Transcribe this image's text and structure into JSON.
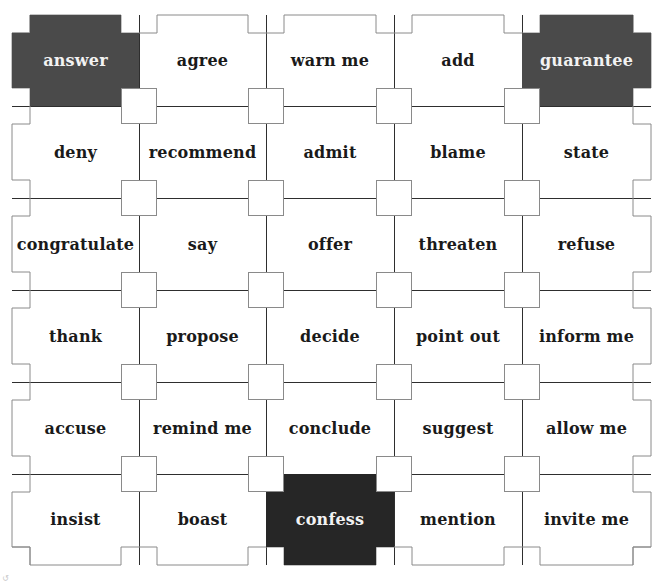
{
  "game": {
    "grid": {
      "rows": 6,
      "cols": 5,
      "cells": [
        [
          {
            "label": "answer",
            "state": "dark"
          },
          {
            "label": "agree",
            "state": "normal"
          },
          {
            "label": "warn me",
            "state": "normal"
          },
          {
            "label": "add",
            "state": "normal"
          },
          {
            "label": "guarantee",
            "state": "dark"
          }
        ],
        [
          {
            "label": "deny",
            "state": "normal"
          },
          {
            "label": "recommend",
            "state": "normal"
          },
          {
            "label": "admit",
            "state": "normal"
          },
          {
            "label": "blame",
            "state": "normal"
          },
          {
            "label": "state",
            "state": "normal"
          }
        ],
        [
          {
            "label": "congratulate",
            "state": "normal"
          },
          {
            "label": "say",
            "state": "normal"
          },
          {
            "label": "offer",
            "state": "normal"
          },
          {
            "label": "threaten",
            "state": "normal"
          },
          {
            "label": "refuse",
            "state": "normal"
          }
        ],
        [
          {
            "label": "thank",
            "state": "normal"
          },
          {
            "label": "propose",
            "state": "normal"
          },
          {
            "label": "decide",
            "state": "normal"
          },
          {
            "label": "point out",
            "state": "normal"
          },
          {
            "label": "inform me",
            "state": "normal"
          }
        ],
        [
          {
            "label": "accuse",
            "state": "normal"
          },
          {
            "label": "remind me",
            "state": "normal"
          },
          {
            "label": "conclude",
            "state": "normal"
          },
          {
            "label": "suggest",
            "state": "normal"
          },
          {
            "label": "allow me",
            "state": "normal"
          }
        ],
        [
          {
            "label": "insist",
            "state": "normal"
          },
          {
            "label": "boast",
            "state": "normal"
          },
          {
            "label": "confess",
            "state": "black"
          },
          {
            "label": "mention",
            "state": "normal"
          },
          {
            "label": "invite me",
            "state": "normal"
          }
        ]
      ]
    },
    "colors": {
      "dark_tile": "#4a4a4a",
      "black_tile": "#262626",
      "tile": "#ffffff",
      "outer_border": "#8a8a8a",
      "inner_line": "#2e2e2e"
    }
  }
}
